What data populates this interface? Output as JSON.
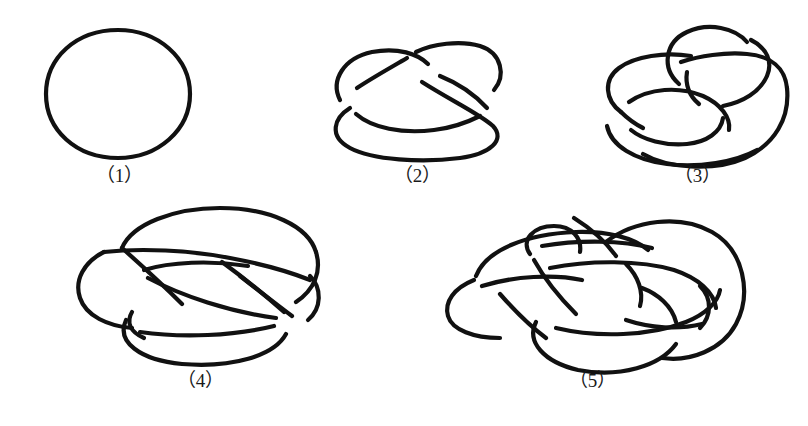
{
  "figure": {
    "background_color": "#ffffff",
    "stroke_color": "#111111",
    "label_color": "#1a1a1a",
    "panel_count": 5,
    "panels": [
      {
        "id": "panel-1",
        "label": "（1）",
        "number": "1",
        "knot_name": "unknot",
        "crossings": 0,
        "description": "simple closed loop, no crossings"
      },
      {
        "id": "panel-2",
        "label": "（2）",
        "number": "2",
        "knot_name": "trefoil",
        "crossings": 3,
        "description": "three-crossing knot drawn as overlapping loops"
      },
      {
        "id": "panel-3",
        "label": "（3）",
        "number": "3",
        "knot_name": "figure-eight",
        "crossings": 4,
        "description": "four-crossing knot with upper twist and lower loop"
      },
      {
        "id": "panel-4",
        "label": "（4）",
        "number": "4",
        "knot_name": "five-crossing knot",
        "crossings": 5,
        "description": "braided oval knot with woven central crossings"
      },
      {
        "id": "panel-5",
        "label": "（5）",
        "number": "5",
        "knot_name": "seven-crossing knot",
        "crossings": 7,
        "description": "most complex diagram, multiple interleaved loops"
      }
    ]
  }
}
